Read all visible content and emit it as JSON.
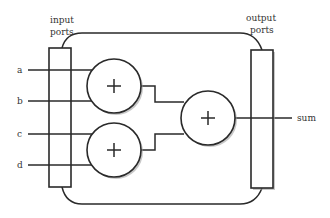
{
  "diagram": {
    "type": "block-diagram",
    "labels": {
      "input_ports": [
        "input",
        "ports"
      ],
      "output_ports": [
        "output",
        "ports"
      ]
    },
    "inputs": [
      {
        "name": "a",
        "y": 70
      },
      {
        "name": "b",
        "y": 101
      },
      {
        "name": "c",
        "y": 134
      },
      {
        "name": "d",
        "y": 165
      }
    ],
    "output": {
      "name": "sum",
      "y": 118
    },
    "adders": [
      {
        "id": "adder-top",
        "symbol": "+",
        "cx": 114,
        "cy": 86,
        "r": 27
      },
      {
        "id": "adder-bottom",
        "symbol": "+",
        "cx": 114,
        "cy": 150,
        "r": 27
      },
      {
        "id": "adder-final",
        "symbol": "+",
        "cx": 208,
        "cy": 118,
        "r": 27
      }
    ],
    "colors": {
      "stroke": "#2a2a2a",
      "text": "#333333",
      "background": "#ffffff"
    }
  }
}
